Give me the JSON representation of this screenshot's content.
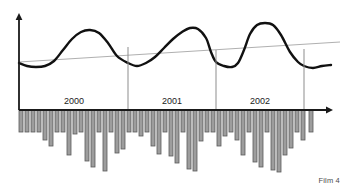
{
  "figure": {
    "caption": "Film 4",
    "background_color": "#ffffff"
  },
  "colors": {
    "axis": "#1a1a1a",
    "curve": "#111111",
    "trend_line": "#b0b0b0",
    "divider": "#8d8d8d",
    "bar_fill": "#9d9d9d",
    "bar_stroke": "#5a5a5a",
    "label_text": "#1a1a1a",
    "caption_text": "#4a4a4a"
  },
  "axes": {
    "y_axis_label": "",
    "x_axis_label": "",
    "origin_x": 19,
    "baseline_y": 110,
    "y_axis_top": 13,
    "x_axis_end": 333
  },
  "year_labels": [
    {
      "text": "2000",
      "x": 74,
      "y": 104
    },
    {
      "text": "2001",
      "x": 172,
      "y": 104
    },
    {
      "text": "2002",
      "x": 260,
      "y": 104
    }
  ],
  "dividers": [
    {
      "x": 128,
      "y_top": 47,
      "y_bottom": 110
    },
    {
      "x": 216,
      "y_top": 50,
      "y_bottom": 110
    },
    {
      "x": 304,
      "y_top": 49,
      "y_bottom": 110
    }
  ],
  "chart_data": {
    "type": "line",
    "title": "",
    "subtitle": "",
    "xlabel": "",
    "ylabel": "",
    "grid": false,
    "legend_position": "none",
    "axis_ranges": {
      "x": [
        0,
        36
      ],
      "y_curve": [
        0,
        100
      ],
      "y_bars": [
        -100,
        0
      ]
    },
    "categories": [
      "2000-01",
      "2000-02",
      "2000-03",
      "2000-04",
      "2000-05",
      "2000-06",
      "2000-07",
      "2000-08",
      "2000-09",
      "2000-10",
      "2000-11",
      "2000-12",
      "2001-01",
      "2001-02",
      "2001-03",
      "2001-04",
      "2001-05",
      "2001-06",
      "2001-07",
      "2001-08",
      "2001-09",
      "2001-10",
      "2001-11",
      "2001-12",
      "2002-01",
      "2002-02",
      "2002-03",
      "2002-04",
      "2002-05",
      "2002-06",
      "2002-07",
      "2002-08",
      "2002-09",
      "2002-10",
      "2002-11",
      "2002-12"
    ],
    "annotations": [
      "2000",
      "2001",
      "2002",
      "Film 4"
    ],
    "series": [
      {
        "name": "seasonal-curve",
        "type": "line",
        "style": "thick-black-smooth",
        "values": [
          52,
          50,
          50,
          52,
          58,
          70,
          82,
          90,
          92,
          88,
          76,
          60,
          52,
          50,
          52,
          58,
          68,
          80,
          90,
          95,
          94,
          84,
          66,
          54,
          51,
          50,
          52,
          62,
          80,
          92,
          96,
          95,
          88,
          70,
          55,
          52
        ],
        "pixel_points": [
          [
            19,
            63
          ],
          [
            27,
            66
          ],
          [
            36,
            67
          ],
          [
            45,
            66
          ],
          [
            54,
            61
          ],
          [
            63,
            50
          ],
          [
            72,
            39
          ],
          [
            81,
            32
          ],
          [
            90,
            30
          ],
          [
            99,
            33
          ],
          [
            108,
            43
          ],
          [
            117,
            56
          ],
          [
            128,
            63
          ],
          [
            137,
            66
          ],
          [
            146,
            63
          ],
          [
            155,
            57
          ],
          [
            164,
            48
          ],
          [
            173,
            39
          ],
          [
            182,
            32
          ],
          [
            190,
            28
          ],
          [
            198,
            29
          ],
          [
            206,
            38
          ],
          [
            211,
            52
          ],
          [
            216,
            62
          ],
          [
            224,
            66
          ],
          [
            232,
            67
          ],
          [
            238,
            63
          ],
          [
            244,
            50
          ],
          [
            250,
            34
          ],
          [
            257,
            25
          ],
          [
            265,
            23
          ],
          [
            273,
            25
          ],
          [
            281,
            35
          ],
          [
            290,
            52
          ],
          [
            298,
            62
          ],
          [
            304,
            66
          ],
          [
            313,
            68
          ],
          [
            322,
            66
          ],
          [
            331,
            65
          ]
        ]
      },
      {
        "name": "trend-line",
        "type": "line",
        "style": "thin-gray-straight",
        "values": [
          47,
          47,
          48,
          48,
          49,
          49,
          50,
          50,
          51,
          51,
          52,
          52,
          53,
          53,
          54,
          54,
          55,
          55,
          56,
          56,
          57,
          57,
          58,
          58,
          58,
          59,
          59,
          59,
          60,
          60,
          60,
          60,
          61,
          61,
          61,
          61
        ],
        "pixel_start": [
          19,
          62
        ],
        "pixel_end": [
          340,
          42
        ]
      },
      {
        "name": "monthly-bars",
        "type": "bar",
        "orientation": "downward",
        "values": [
          -22,
          -22,
          -22,
          -22,
          -30,
          -35,
          -22,
          -22,
          -44,
          -23,
          -22,
          -50,
          -56,
          -22,
          -60,
          -22,
          -42,
          -38,
          -22,
          -22,
          -25,
          -22,
          -35,
          -43,
          -22,
          -45,
          -52,
          -22,
          -58,
          -60,
          -30,
          -22,
          -22,
          -35,
          -25,
          -22
        ],
        "pixel_bars": [
          {
            "x": 19,
            "w": 4,
            "h": 22
          },
          {
            "x": 25,
            "w": 4,
            "h": 22
          },
          {
            "x": 31,
            "w": 4,
            "h": 22
          },
          {
            "x": 37,
            "w": 4,
            "h": 22
          },
          {
            "x": 43,
            "w": 4,
            "h": 30
          },
          {
            "x": 49,
            "w": 4,
            "h": 36
          },
          {
            "x": 55,
            "w": 4,
            "h": 22
          },
          {
            "x": 61,
            "w": 4,
            "h": 22
          },
          {
            "x": 67,
            "w": 4,
            "h": 45
          },
          {
            "x": 73,
            "w": 4,
            "h": 24
          },
          {
            "x": 79,
            "w": 4,
            "h": 22
          },
          {
            "x": 85,
            "w": 4,
            "h": 51
          },
          {
            "x": 91,
            "w": 4,
            "h": 57
          },
          {
            "x": 97,
            "w": 4,
            "h": 22
          },
          {
            "x": 103,
            "w": 4,
            "h": 61
          },
          {
            "x": 109,
            "w": 4,
            "h": 22
          },
          {
            "x": 115,
            "w": 4,
            "h": 43
          },
          {
            "x": 121,
            "w": 4,
            "h": 39
          },
          {
            "x": 127,
            "w": 4,
            "h": 22
          },
          {
            "x": 133,
            "w": 4,
            "h": 22
          },
          {
            "x": 139,
            "w": 4,
            "h": 26
          },
          {
            "x": 145,
            "w": 4,
            "h": 22
          },
          {
            "x": 151,
            "w": 4,
            "h": 36
          },
          {
            "x": 157,
            "w": 4,
            "h": 44
          },
          {
            "x": 163,
            "w": 4,
            "h": 22
          },
          {
            "x": 169,
            "w": 4,
            "h": 46
          },
          {
            "x": 175,
            "w": 4,
            "h": 53
          },
          {
            "x": 181,
            "w": 4,
            "h": 22
          },
          {
            "x": 187,
            "w": 4,
            "h": 59
          },
          {
            "x": 193,
            "w": 4,
            "h": 61
          },
          {
            "x": 199,
            "w": 4,
            "h": 31
          },
          {
            "x": 205,
            "w": 4,
            "h": 22
          },
          {
            "x": 211,
            "w": 4,
            "h": 22
          },
          {
            "x": 217,
            "w": 4,
            "h": 36
          },
          {
            "x": 223,
            "w": 4,
            "h": 26
          },
          {
            "x": 229,
            "w": 4,
            "h": 22
          },
          {
            "x": 235,
            "w": 4,
            "h": 30
          },
          {
            "x": 241,
            "w": 4,
            "h": 45
          },
          {
            "x": 247,
            "w": 4,
            "h": 22
          },
          {
            "x": 253,
            "w": 4,
            "h": 52
          },
          {
            "x": 259,
            "w": 4,
            "h": 57
          },
          {
            "x": 265,
            "w": 4,
            "h": 22
          },
          {
            "x": 271,
            "w": 4,
            "h": 60
          },
          {
            "x": 277,
            "w": 4,
            "h": 62
          },
          {
            "x": 283,
            "w": 4,
            "h": 45
          },
          {
            "x": 289,
            "w": 4,
            "h": 38
          },
          {
            "x": 295,
            "w": 4,
            "h": 22
          },
          {
            "x": 301,
            "w": 4,
            "h": 30
          },
          {
            "x": 309,
            "w": 4,
            "h": 22
          }
        ]
      }
    ]
  }
}
